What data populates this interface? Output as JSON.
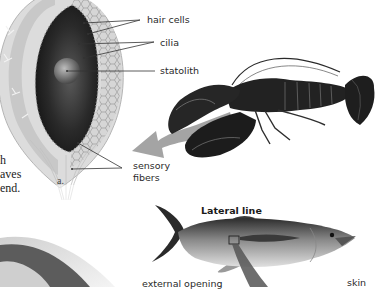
{
  "statocyst": {
    "labels": {
      "hair_cells": "hair cells",
      "cilia": "cilia",
      "statolith": "statolith",
      "sensory_fibers_line1": "sensory",
      "sensory_fibers_line2": "fibers"
    },
    "panel_letter": "a."
  },
  "body_text_fragment": {
    "line1": "h",
    "line2": "aves",
    "line3": "end."
  },
  "fish": {
    "title": "Lateral line",
    "labels": {
      "external_opening": "external opening",
      "skin": "skin"
    }
  },
  "colors": {
    "arrow": "#9a9a9a",
    "label_text": "#2a2a2a",
    "leader_line": "#333333"
  }
}
